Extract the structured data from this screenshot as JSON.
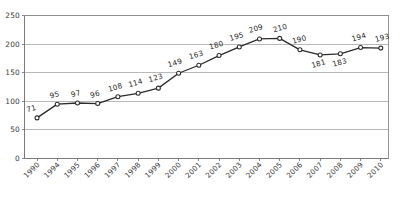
{
  "chart_data": {
    "type": "line",
    "title": "",
    "subtitle": "",
    "xlabel": "",
    "ylabel": "",
    "categories": [
      "1990",
      "1994",
      "1995",
      "1996",
      "1997",
      "1998",
      "1999",
      "2000",
      "2001",
      "2002",
      "2003",
      "2004",
      "2005",
      "2006",
      "2007",
      "2008",
      "2009",
      "2010"
    ],
    "values": [
      71,
      95,
      97,
      96,
      108,
      114,
      123,
      149,
      163,
      180,
      195,
      209,
      210,
      190,
      181,
      183,
      194,
      193
    ],
    "point_labels": [
      "71",
      "95",
      "97",
      "96",
      "108",
      "114",
      "123",
      "149",
      "163",
      "180",
      "195",
      "209",
      "210",
      "190",
      "181",
      "183",
      "194",
      "193"
    ],
    "ylim": [
      0,
      250
    ],
    "yticks": [
      0,
      50,
      100,
      150,
      200,
      250
    ],
    "ytick_labels": [
      "0",
      "50",
      "100",
      "150",
      "200",
      "250"
    ],
    "grid": true,
    "grid_axis": "y",
    "legend": false,
    "legend_position": "none",
    "marker": "open-circle",
    "series": [
      {
        "name": "",
        "values": [
          71,
          95,
          97,
          96,
          108,
          114,
          123,
          149,
          163,
          180,
          195,
          209,
          210,
          190,
          181,
          183,
          194,
          193
        ],
        "color": "#2b2b2b"
      }
    ],
    "colors": {
      "line": "#2b2b2b",
      "marker_fill": "#ffffff",
      "marker_stroke": "#2b2b2b",
      "grid": "#a8a8a8",
      "axis": "#7a7a7a",
      "text": "#1f1f1f",
      "background": "#ffffff"
    },
    "label_offsets": [
      {
        "dx": -5,
        "dy": -7
      },
      {
        "dx": -2,
        "dy": -7
      },
      {
        "dx": -1,
        "dy": -7
      },
      {
        "dx": -2,
        "dy": -7
      },
      {
        "dx": -2,
        "dy": -7
      },
      {
        "dx": -2,
        "dy": -8
      },
      {
        "dx": -2,
        "dy": -8
      },
      {
        "dx": -3,
        "dy": -8
      },
      {
        "dx": -2,
        "dy": -8
      },
      {
        "dx": -2,
        "dy": -8
      },
      {
        "dx": -2,
        "dy": -8
      },
      {
        "dx": -3,
        "dy": -8
      },
      {
        "dx": 1,
        "dy": -8
      },
      {
        "dx": 0,
        "dy": -8
      },
      {
        "dx": -1,
        "dy": 11
      },
      {
        "dx": 0,
        "dy": 11
      },
      {
        "dx": -1,
        "dy": -8
      },
      {
        "dx": 2,
        "dy": -8
      }
    ]
  }
}
